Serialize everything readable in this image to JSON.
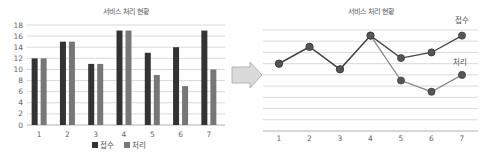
{
  "chart_data": [
    {
      "type": "bar",
      "title": "서비스 처리 현황",
      "categories": [
        "1",
        "2",
        "3",
        "4",
        "5",
        "6",
        "7"
      ],
      "series": [
        {
          "name": "접수",
          "color": "#333333",
          "values": [
            12,
            15,
            11,
            17,
            13,
            14,
            17
          ]
        },
        {
          "name": "처리",
          "color": "#777777",
          "values": [
            12,
            15,
            11,
            17,
            9,
            7,
            10
          ]
        }
      ],
      "yticks": [
        "0",
        "2",
        "4",
        "6",
        "8",
        "10",
        "12",
        "14",
        "16",
        "18"
      ],
      "ylim": [
        0,
        18
      ],
      "xlabel": "",
      "ylabel": "",
      "grid": true,
      "legend_position": "bottom"
    },
    {
      "type": "line",
      "title": "서비스 처리 현황",
      "categories": [
        "1",
        "2",
        "3",
        "4",
        "5",
        "6",
        "7"
      ],
      "series": [
        {
          "name": "접수",
          "color": "#444444",
          "values": [
            12,
            15,
            11,
            17,
            13,
            14,
            17
          ]
        },
        {
          "name": "처리",
          "color": "#888888",
          "values": [
            12,
            15,
            11,
            17,
            9,
            7,
            10
          ]
        }
      ],
      "ylim": [
        0,
        18
      ],
      "xlabel": "",
      "ylabel": "",
      "grid": true,
      "legend_position": "inline labels at right"
    }
  ],
  "arrow": {
    "icon": "right-arrow-icon",
    "color": "#d9d9d9"
  }
}
